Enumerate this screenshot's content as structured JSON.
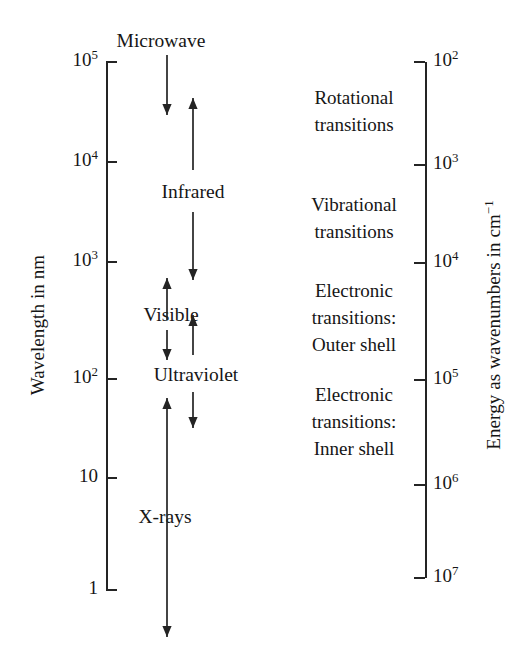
{
  "figure": {
    "type": "electromagnetic-spectrum-scale-diagram",
    "background": "#ffffff",
    "ink_color": "#242424"
  },
  "left_axis": {
    "title": "Wavelength in nm",
    "scale": "log10",
    "unit": "nm",
    "direction": "decreasing-downward",
    "ticks": [
      {
        "label_base": "10",
        "label_exp": "5",
        "value": 100000,
        "y": 62
      },
      {
        "label_base": "10",
        "label_exp": "4",
        "value": 10000,
        "y": 162
      },
      {
        "label_base": "10",
        "label_exp": "3",
        "value": 1000,
        "y": 262
      },
      {
        "label_base": "10",
        "label_exp": "2",
        "value": 100,
        "y": 379
      },
      {
        "label_base": "10",
        "label_exp": "",
        "value": 10,
        "y": 478
      },
      {
        "label_base": "1",
        "label_exp": "",
        "value": 1,
        "y": 590
      }
    ]
  },
  "right_axis": {
    "title_main": "Energy as wavenumbers in cm",
    "title_exp": "−1",
    "scale": "log10",
    "unit": "cm^-1",
    "direction": "increasing-downward",
    "ticks": [
      {
        "label_base": "10",
        "label_exp": "2",
        "value": 100,
        "y": 62
      },
      {
        "label_base": "10",
        "label_exp": "3",
        "value": 1000,
        "y": 165
      },
      {
        "label_base": "10",
        "label_exp": "4",
        "value": 10000,
        "y": 263
      },
      {
        "label_base": "10",
        "label_exp": "5",
        "value": 100000,
        "y": 380
      },
      {
        "label_base": "10",
        "label_exp": "6",
        "value": 1000000,
        "y": 485
      },
      {
        "label_base": "10",
        "label_exp": "7",
        "value": 10000000,
        "y": 578
      }
    ]
  },
  "bands": [
    {
      "name": "Microwave",
      "x": 161,
      "y": 41
    },
    {
      "name": "Infrared",
      "x": 193,
      "y": 192
    },
    {
      "name": "Visible",
      "x": 171,
      "y": 315
    },
    {
      "name": "Ultraviolet",
      "x": 196,
      "y": 375
    },
    {
      "name": "X-rays",
      "x": 165,
      "y": 517
    }
  ],
  "transitions": [
    {
      "lines": [
        "Rotational",
        "transitions"
      ],
      "y": 112
    },
    {
      "lines": [
        "Vibrational",
        "transitions"
      ],
      "y": 219
    },
    {
      "lines": [
        "Electronic",
        "transitions:",
        "Outer shell"
      ],
      "y": 318
    },
    {
      "lines": [
        "Electronic",
        "transitions:",
        "Inner shell"
      ],
      "y": 422
    }
  ],
  "arrows": [
    {
      "name": "microwave-down-arrow",
      "x": 167,
      "y1": 55,
      "y2": 115,
      "head": "down"
    },
    {
      "name": "infrared-up-arrow",
      "x": 193,
      "y1": 170,
      "y2": 98,
      "head": "up"
    },
    {
      "name": "infrared-down-arrow",
      "x": 193,
      "y1": 212,
      "y2": 280,
      "head": "down"
    },
    {
      "name": "visible-up-arrow",
      "x": 167,
      "y1": 320,
      "y2": 278,
      "head": "up"
    },
    {
      "name": "visible-down-arrow",
      "x": 167,
      "y1": 330,
      "y2": 360,
      "head": "down"
    },
    {
      "name": "ultraviolet-up-arrow",
      "x": 193,
      "y1": 355,
      "y2": 315,
      "head": "up"
    },
    {
      "name": "ultraviolet-down-arrow",
      "x": 193,
      "y1": 392,
      "y2": 428,
      "head": "down"
    },
    {
      "name": "xray-double-arrow",
      "x": 167,
      "y1": 398,
      "y2": 637,
      "head": "both"
    }
  ]
}
